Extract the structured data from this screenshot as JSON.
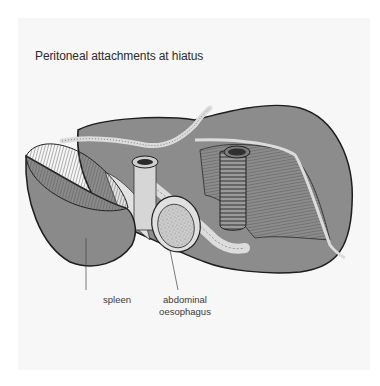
{
  "figure": {
    "title": "Peritoneal attachments at hiatus",
    "labels": {
      "spleen": "spleen",
      "oesophagus_line1": "abdominal",
      "oesophagus_line2": "oesophagus"
    },
    "colors": {
      "background": "#f7f7f7",
      "organ_fill": "#8c8c8c",
      "organ_outline": "#1e1e1e",
      "peritoneum_fill": "#dcdcdc",
      "spleen_cut": "#7a7a7a",
      "label_text": "#3a3a3a"
    }
  }
}
